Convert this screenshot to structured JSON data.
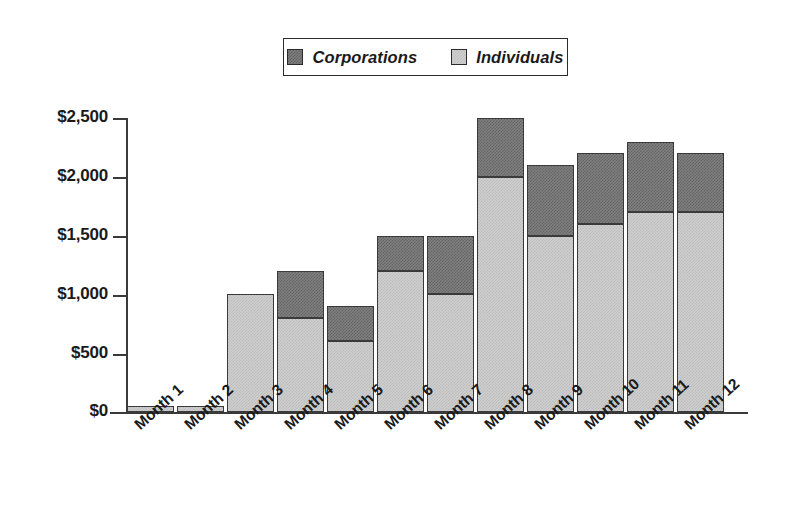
{
  "chart_data": {
    "type": "bar",
    "subtype": "stacked-vertical",
    "title": "",
    "subtitle": "",
    "xlabel": "",
    "ylabel": "",
    "categories": [
      "Month 1",
      "Month 2",
      "Month 3",
      "Month 4",
      "Month 5",
      "Month 6",
      "Month 7",
      "Month 8",
      "Month 9",
      "Month 10",
      "Month 11",
      "Month 12"
    ],
    "series": [
      {
        "name": "Individuals",
        "color": "#cfcfcf",
        "values": [
          50,
          50,
          1000,
          800,
          600,
          1200,
          1000,
          2000,
          1500,
          1600,
          1700,
          1700
        ]
      },
      {
        "name": "Corporations",
        "color": "#808080",
        "values": [
          0,
          0,
          0,
          400,
          300,
          300,
          500,
          500,
          600,
          600,
          600,
          500
        ]
      }
    ],
    "totals": [
      50,
      50,
      1000,
      1200,
      900,
      1500,
      1500,
      2500,
      2100,
      2200,
      2300,
      2200
    ],
    "stack_order": [
      "Individuals",
      "Corporations"
    ],
    "ylim": [
      0,
      2500
    ],
    "ytick_values": [
      0,
      500,
      1000,
      1500,
      2000,
      2500
    ],
    "ytick_labels": [
      "$0",
      "$500",
      "$1,000",
      "$1,500",
      "$2,000",
      "$2,500"
    ],
    "grid": false,
    "legend_position": "top-center",
    "xtick_label_rotation": -42
  },
  "legend": {
    "entries": [
      {
        "label": "Corporations",
        "swatch": "dark-gray-dither"
      },
      {
        "label": "Individuals",
        "swatch": "light-gray-dither"
      }
    ]
  },
  "axes": {
    "y_ticks": [
      {
        "label": "$2,500",
        "value": 2500
      },
      {
        "label": "$2,000",
        "value": 2000
      },
      {
        "label": "$1,500",
        "value": 1500
      },
      {
        "label": "$1,000",
        "value": 1000
      },
      {
        "label": "$500",
        "value": 500
      },
      {
        "label": "$0",
        "value": 0
      }
    ]
  },
  "colors": {
    "series_corporations": "#808080",
    "series_individuals": "#cfcfcf",
    "axis": "#3a3a3a",
    "text": "#1a1a1a",
    "background": "#ffffff"
  }
}
